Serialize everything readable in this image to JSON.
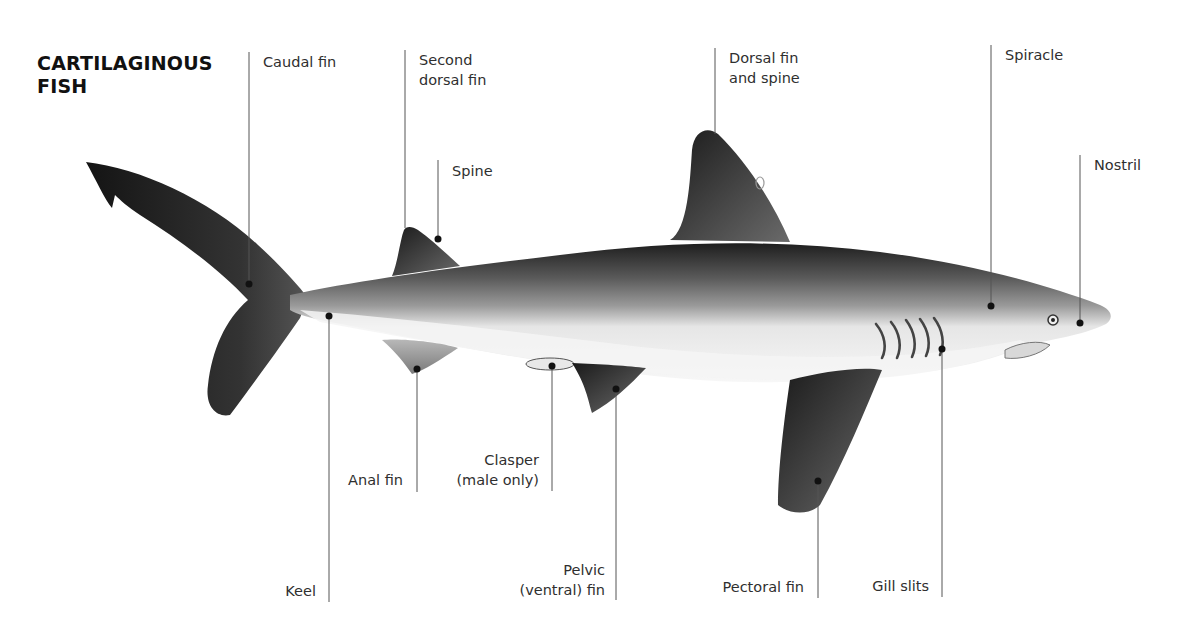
{
  "title": {
    "line1": "CARTILAGINOUS",
    "line2": "FISH"
  },
  "labels": {
    "caudal_fin": "Caudal fin",
    "second_dorsal_fin": {
      "line1": "Second",
      "line2": "dorsal fin"
    },
    "spine": "Spine",
    "dorsal_fin_and_spine": {
      "line1": "Dorsal fin",
      "line2": "and spine"
    },
    "spiracle": "Spiracle",
    "nostril": "Nostril",
    "anal_fin": "Anal fin",
    "clasper": {
      "line1": "Clasper",
      "line2": "(male only)"
    },
    "keel": "Keel",
    "pelvic_fin": {
      "line1": "Pelvic",
      "line2": "(ventral) fin"
    },
    "pectoral_fin": "Pectoral fin",
    "gill_slits": "Gill slits"
  },
  "colors": {
    "background": "#ffffff",
    "leader_line": "#555555",
    "text": "#2f2f2f",
    "shark_dark": "#2a2a2a",
    "shark_mid": "#7a7a7a",
    "shark_belly": "#f2f2f2"
  }
}
